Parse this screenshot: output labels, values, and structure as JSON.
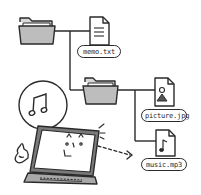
{
  "diagram": {
    "type": "file-tree-illustration",
    "colors": {
      "stroke": "#2a2a2a",
      "folder_fill": "#bdbdbd",
      "folder_back": "#d9d9d9",
      "laptop_base": "#a8a8a8",
      "background": "#ffffff"
    },
    "nodes": [
      {
        "id": "root-folder",
        "kind": "folder"
      },
      {
        "id": "memo",
        "kind": "text-file",
        "label": "memo.txt"
      },
      {
        "id": "sub-folder",
        "kind": "folder"
      },
      {
        "id": "picture",
        "kind": "image-file",
        "label": "picture.jpg"
      },
      {
        "id": "music",
        "kind": "audio-file",
        "label": "music.mp3"
      }
    ],
    "edges": [
      {
        "from": "root-folder",
        "to": "memo"
      },
      {
        "from": "root-folder",
        "to": "sub-folder"
      },
      {
        "from": "sub-folder",
        "to": "picture"
      },
      {
        "from": "sub-folder",
        "to": "music"
      }
    ],
    "character": {
      "kind": "laptop-with-face",
      "speech_bubble_icon": "music-note-icon",
      "gesture": "thumbs-up-icon",
      "arrow_to": "music",
      "arrow_style": "dashed"
    }
  },
  "labels": {
    "memo": "memo.txt",
    "picture": "picture.jpg",
    "music": "music.mp3"
  }
}
